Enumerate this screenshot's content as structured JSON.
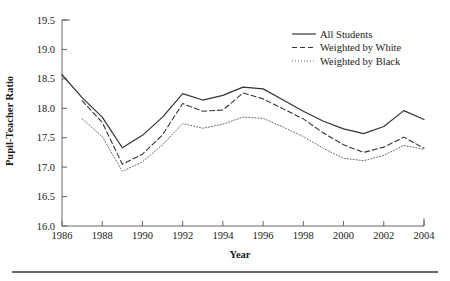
{
  "chart_data": {
    "type": "line",
    "title": "",
    "xlabel": "Year",
    "ylabel": "Pupil-Teacher Ratio",
    "xlim": [
      1986,
      2004
    ],
    "ylim": [
      16.0,
      19.5
    ],
    "grid": false,
    "legend_position": "top-right",
    "x": [
      1986,
      1987,
      1988,
      1989,
      1990,
      1991,
      1992,
      1993,
      1994,
      1995,
      1996,
      1997,
      1998,
      1999,
      2000,
      2001,
      2002,
      2003,
      2004
    ],
    "xticks": [
      "1986",
      "1988",
      "1990",
      "1992",
      "1994",
      "1996",
      "1998",
      "2000",
      "2002",
      "2004"
    ],
    "xtick_values": [
      1986,
      1988,
      1990,
      1992,
      1994,
      1996,
      1998,
      2000,
      2002,
      2004
    ],
    "yticks": [
      "16.0",
      "16.5",
      "17.0",
      "17.5",
      "18.0",
      "18.5",
      "19.0",
      "19.5"
    ],
    "ytick_values": [
      16.0,
      16.5,
      17.0,
      17.5,
      18.0,
      18.5,
      19.0,
      19.5
    ],
    "series": [
      {
        "name": "All Students",
        "style": "solid",
        "color": "#333333",
        "x": [
          1986,
          1987,
          1988,
          1989,
          1990,
          1991,
          1992,
          1993,
          1994,
          1995,
          1996,
          1997,
          1998,
          1999,
          2000,
          2001,
          2002,
          2003,
          2004
        ],
        "values": [
          18.57,
          18.18,
          17.85,
          17.33,
          17.54,
          17.85,
          18.25,
          18.14,
          18.22,
          18.36,
          18.33,
          18.14,
          17.95,
          17.78,
          17.65,
          17.57,
          17.69,
          17.96,
          17.81
        ]
      },
      {
        "name": "Weighted by White",
        "style": "dashed",
        "color": "#333333",
        "x": [
          1987,
          1988,
          1989,
          1990,
          1991,
          1992,
          1993,
          1994,
          1995,
          1996,
          1997,
          1998,
          1999,
          2000,
          2001,
          2002,
          2003,
          2004
        ],
        "values": [
          18.13,
          17.76,
          17.05,
          17.22,
          17.55,
          18.08,
          17.95,
          17.97,
          18.26,
          18.16,
          17.99,
          17.82,
          17.58,
          17.38,
          17.25,
          17.34,
          17.51,
          17.32
        ]
      },
      {
        "name": "Weighted by Black",
        "style": "dotted",
        "color": "#666666",
        "x": [
          1987,
          1988,
          1989,
          1990,
          1991,
          1992,
          1993,
          1994,
          1995,
          1996,
          1997,
          1998,
          1999,
          2000,
          2001,
          2002,
          2003,
          2004
        ],
        "values": [
          17.82,
          17.52,
          16.93,
          17.09,
          17.38,
          17.74,
          17.66,
          17.73,
          17.85,
          17.83,
          17.68,
          17.52,
          17.32,
          17.15,
          17.11,
          17.2,
          17.37,
          17.3
        ]
      }
    ]
  },
  "legend": {
    "entries": [
      {
        "label": "All Students",
        "style": "solid"
      },
      {
        "label": "Weighted by White",
        "style": "dashed"
      },
      {
        "label": "Weighted by Black",
        "style": "dotted"
      }
    ]
  },
  "colors": {
    "axis": "#555555",
    "text": "#1a1a1a",
    "solid_series": "#333333",
    "dotted_series": "#666666",
    "footer_rule": "#3a3a3a"
  }
}
